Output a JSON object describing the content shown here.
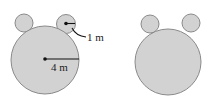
{
  "figures": [
    {
      "name": "labeled-bear-shape",
      "head": {
        "cx": 45,
        "cy": 60,
        "r": 34
      },
      "ears": [
        {
          "cx": 24,
          "cy": 23,
          "r": 9
        },
        {
          "cx": 66,
          "cy": 24,
          "r": 9.5
        }
      ],
      "labels": {
        "small_radius": "1 m",
        "large_radius": "4 m"
      }
    },
    {
      "name": "unlabeled-bear-shape",
      "head": {
        "cx": 168,
        "cy": 62,
        "r": 33
      },
      "ears": [
        {
          "cx": 150,
          "cy": 24,
          "r": 9
        },
        {
          "cx": 191,
          "cy": 23,
          "r": 9
        }
      ]
    }
  ],
  "colors": {
    "fill": "#d2d2d2",
    "stroke": "#8a8a8a",
    "ink": "#111111"
  }
}
